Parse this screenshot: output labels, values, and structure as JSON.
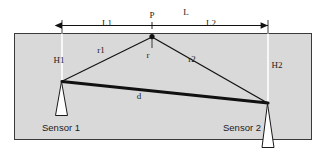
{
  "figure": {
    "type": "technical-diagram",
    "background_color": "#ffffff",
    "medium_color": "#d9d9d9",
    "border_color": "#3a3a3a",
    "line_color": "#111111"
  },
  "labels": {
    "total_span": "L",
    "left_span": "L1",
    "right_span": "L2",
    "source_point": "P",
    "depth_center": "r",
    "range_left": "r1",
    "range_right": "r2",
    "sensor_separation": "d",
    "height_left": "H1",
    "height_right": "H2",
    "sensor_left": "Sensor 1",
    "sensor_right": "Sensor 2"
  },
  "geometry": {
    "medium_rect": {
      "x": 14,
      "y": 33,
      "width": 298,
      "height": 107
    },
    "point_p": {
      "x": 152,
      "y": 36
    },
    "sensor1_point": {
      "x": 62,
      "y": 81
    },
    "sensor2_point": {
      "x": 268,
      "y": 103
    },
    "dimension_line_y": 25,
    "dimension_left_x": 62,
    "dimension_right_x": 268
  }
}
